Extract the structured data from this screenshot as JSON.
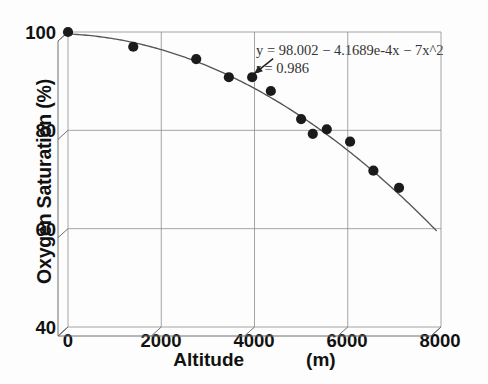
{
  "chart_data": {
    "type": "scatter",
    "title": "",
    "xlabel": "Altitude",
    "xlabel_unit": "(m)",
    "ylabel": "Oxygen Saturation (%)",
    "xlim": [
      0,
      8000
    ],
    "ylim": [
      40,
      100
    ],
    "xticks": [
      "0",
      "2000",
      "4000",
      "6000",
      "8000"
    ],
    "xtick_values": [
      0,
      2000,
      4000,
      6000,
      8000
    ],
    "yticks": [
      "40",
      "60",
      "80",
      "100"
    ],
    "ytick_values": [
      40,
      60,
      80,
      100
    ],
    "grid": true,
    "legend": "none",
    "marker": "filled-circle",
    "marker_color": "#1b1b1b",
    "curve_color": "#555555",
    "points": [
      {
        "x": 0,
        "y": 100.0
      },
      {
        "x": 1400,
        "y": 97.0
      },
      {
        "x": 2750,
        "y": 94.5
      },
      {
        "x": 3450,
        "y": 90.8
      },
      {
        "x": 3950,
        "y": 90.8
      },
      {
        "x": 4350,
        "y": 88.0
      },
      {
        "x": 5000,
        "y": 82.3
      },
      {
        "x": 5250,
        "y": 79.3
      },
      {
        "x": 5550,
        "y": 80.2
      },
      {
        "x": 6050,
        "y": 77.7
      },
      {
        "x": 6550,
        "y": 71.8
      },
      {
        "x": 7100,
        "y": 68.3
      }
    ],
    "fit_curve": {
      "kind": "quadratic",
      "intercept": 98.002,
      "linear_coeff": -0.00041689,
      "x_start": 0,
      "x_end": 7900,
      "y_start": 99.6,
      "y_end": 59.6
    },
    "annotations": [
      {
        "name": "fit-equation",
        "line1": "y  =  98.002  −  4.1689e-4x  −  7x^2",
        "line2": "r  =  0.986",
        "arrow": {
          "from_x": 3990,
          "from_y": 91.5,
          "to_x": 4400,
          "to_y": 94.6
        }
      }
    ]
  }
}
